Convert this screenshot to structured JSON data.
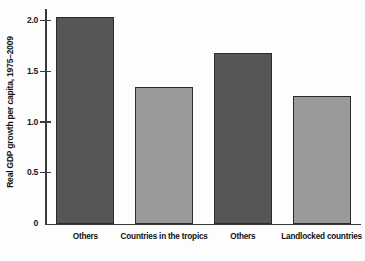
{
  "chart_data": {
    "type": "bar",
    "title": "",
    "subtitle": "",
    "xlabel": "",
    "ylabel": "Real GDP growth per capita, 1975–2009",
    "categories": [
      "Others",
      "Countries in the tropics",
      "Others",
      "Landlocked countries"
    ],
    "values": [
      2.04,
      1.35,
      1.69,
      1.26
    ],
    "series": [
      {
        "name": "Real GDP growth per capita, 1975–2009",
        "values": [
          2.04,
          1.35,
          1.69,
          1.26
        ]
      }
    ],
    "bar_styles": [
      "dark",
      "light",
      "dark",
      "light"
    ],
    "colors": {
      "dark_bar": "#565656",
      "light_bar": "#9a9a9a",
      "bar_border": "#2b2b2b",
      "axis": "#3a3a3a",
      "background": "#fdfdfd",
      "text": "#111111"
    },
    "ylim": [
      0,
      2.12
    ],
    "yticks": [
      0,
      0.5,
      1.0,
      1.5,
      2.0
    ],
    "ytick_labels": [
      "0",
      "0.5",
      "1.0",
      "1.5",
      "2.0"
    ],
    "grid": false,
    "legend": null,
    "legend_position": "none",
    "annotations": []
  }
}
